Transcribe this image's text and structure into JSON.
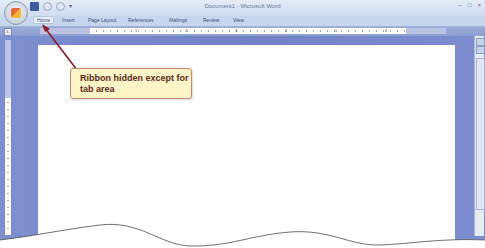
{
  "window": {
    "title": "Document1 - Microsoft Word",
    "controls": {
      "minimize": "–",
      "maximize": "□",
      "close": "×"
    }
  },
  "quick_access": {
    "save_icon": "save-icon",
    "undo_icon": "undo-icon",
    "redo_icon": "redo-icon",
    "more": "▾"
  },
  "ribbon": {
    "tabs": [
      {
        "label": "Home",
        "active": true
      },
      {
        "label": "Insert"
      },
      {
        "label": "Page Layout"
      },
      {
        "label": "References"
      },
      {
        "label": "Mailings"
      },
      {
        "label": "Review"
      },
      {
        "label": "View"
      }
    ]
  },
  "ruler": {
    "tab_selector": "L",
    "numbers": [
      "1",
      "2",
      "3",
      "4",
      "5",
      "6"
    ]
  },
  "callout": {
    "text": "Ribbon hidden except for tab area"
  },
  "colors": {
    "callout_bg": "#fdf4c7",
    "callout_border": "#c88a6c",
    "callout_text": "#5a2a17",
    "arrow": "#8b1a24",
    "workspace": "#7486c8"
  }
}
